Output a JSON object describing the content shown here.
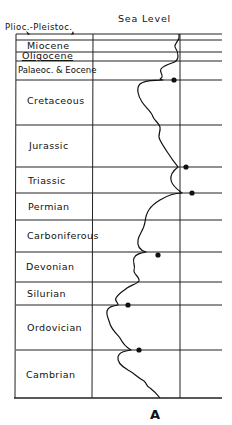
{
  "diagram": {
    "header": {
      "sea_level_label": "Sea Level",
      "top_period_label": "Plioc.-Pleistoc."
    },
    "figure_label": "A",
    "periods": [
      {
        "name": "Miocene",
        "top_y": 40,
        "bottom_y": 52
      },
      {
        "name": "Oligocene",
        "top_y": 52,
        "bottom_y": 61
      },
      {
        "name": "Palaeoc. & Eocene",
        "top_y": 61,
        "bottom_y": 80
      },
      {
        "name": "Cretaceous",
        "top_y": 80,
        "bottom_y": 125
      },
      {
        "name": "Jurassic",
        "top_y": 125,
        "bottom_y": 167
      },
      {
        "name": "Triassic",
        "top_y": 167,
        "bottom_y": 193
      },
      {
        "name": "Permian",
        "top_y": 193,
        "bottom_y": 220
      },
      {
        "name": "Carboniferous",
        "top_y": 220,
        "bottom_y": 252
      },
      {
        "name": "Devonian",
        "top_y": 252,
        "bottom_y": 282
      },
      {
        "name": "Silurian",
        "top_y": 282,
        "bottom_y": 305
      },
      {
        "name": "Ordovician",
        "top_y": 305,
        "bottom_y": 350
      },
      {
        "name": "Cambrian",
        "top_y": 350,
        "bottom_y": 398
      }
    ],
    "markers": [
      {
        "boundary": "Palaeoc. & Eocene / Cretaceous",
        "x": 174,
        "y": 80
      },
      {
        "boundary": "Jurassic / Triassic",
        "x": 186,
        "y": 167
      },
      {
        "boundary": "Triassic / Permian",
        "x": 192,
        "y": 193
      },
      {
        "boundary": "Carboniferous / Devonian",
        "x": 158,
        "y": 255
      },
      {
        "boundary": "Silurian / Ordovician",
        "x": 128,
        "y": 305
      },
      {
        "boundary": "Ordovician / Cambrian",
        "x": 139,
        "y": 350
      }
    ],
    "colors": {
      "ink": "#111111",
      "background": "#ffffff"
    }
  }
}
